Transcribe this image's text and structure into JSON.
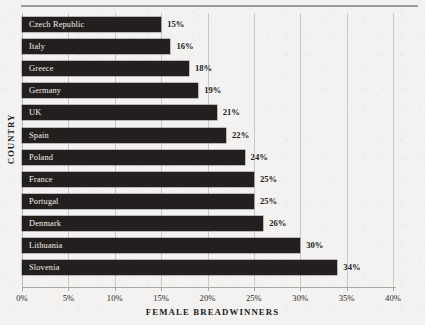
{
  "chart_data": {
    "type": "bar",
    "orientation": "horizontal",
    "title": "",
    "xlabel": "FEMALE BREADWINNERS",
    "ylabel": "COUNTRY",
    "xlim": [
      0,
      40
    ],
    "xtick_labels": [
      "0%",
      "5%",
      "10%",
      "15%",
      "20%",
      "25%",
      "30%",
      "35%",
      "40%"
    ],
    "xtick_values": [
      0,
      5,
      10,
      15,
      20,
      25,
      30,
      35,
      40
    ],
    "grid": "vertical",
    "legend": "none",
    "categories": [
      "Czech Republic",
      "Italy",
      "Greece",
      "Germany",
      "UK",
      "Spain",
      "Poland",
      "France",
      "Portugal",
      "Denmark",
      "Lithuania",
      "Slovenia"
    ],
    "values": [
      15,
      16,
      18,
      19,
      21,
      22,
      24,
      25,
      25,
      26,
      30,
      34
    ],
    "value_labels": [
      "15%",
      "16%",
      "18%",
      "19%",
      "21%",
      "22%",
      "24%",
      "25%",
      "25%",
      "26%",
      "30%",
      "34%"
    ],
    "bars": [
      {
        "category": "Czech Republic",
        "value": 15,
        "value_label": "15%"
      },
      {
        "category": "Italy",
        "value": 16,
        "value_label": "16%"
      },
      {
        "category": "Greece",
        "value": 18,
        "value_label": "18%"
      },
      {
        "category": "Germany",
        "value": 19,
        "value_label": "19%"
      },
      {
        "category": "UK",
        "value": 21,
        "value_label": "21%"
      },
      {
        "category": "Spain",
        "value": 22,
        "value_label": "22%"
      },
      {
        "category": "Poland",
        "value": 24,
        "value_label": "24%"
      },
      {
        "category": "France",
        "value": 25,
        "value_label": "25%"
      },
      {
        "category": "Portugal",
        "value": 25,
        "value_label": "25%"
      },
      {
        "category": "Denmark",
        "value": 26,
        "value_label": "26%"
      },
      {
        "category": "Lithuania",
        "value": 30,
        "value_label": "30%"
      },
      {
        "category": "Slovenia",
        "value": 34,
        "value_label": "34%"
      }
    ],
    "colors": {
      "background": "#f3f2f0",
      "bar": "#231f1e",
      "bar_label_text": "#f0efeb",
      "value_label_text": "#1b1b1b",
      "gridline": "#c9c8c4",
      "axis": "#a9a8a4",
      "top_rule": "#9a9a98"
    }
  }
}
